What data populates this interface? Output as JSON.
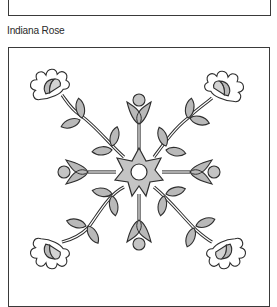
{
  "caption": {
    "title": "Indiana Rose"
  },
  "illustration": {
    "subject": "quilt-block-pattern",
    "motifs": [
      "center-star",
      "tulip",
      "carnation",
      "leaf",
      "stem"
    ],
    "colors": {
      "outline": "#2e2e2e",
      "fill_gray": "#b9b9b9",
      "fill_light": "#d3d3d3",
      "background": "#ffffff"
    }
  }
}
